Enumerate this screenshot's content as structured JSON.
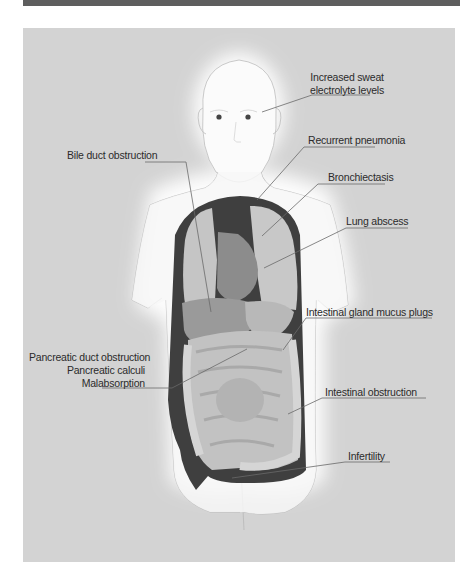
{
  "figure": {
    "colors": {
      "top_bar": "#5e5e5e",
      "panel_background": "#d3d3d3",
      "body_fill": "#f7f7f7",
      "body_glow": "#ffffff",
      "cavity_dark": "#404040",
      "organ_light": "#c4c4c4",
      "organ_mid": "#a8a8a8",
      "organ_dark": "#8e8e8e",
      "leader_line": "#6a6a6a"
    },
    "labels": {
      "sweat": "Increased sweat electrolyte levels",
      "sweat_line1": "Increased sweat",
      "sweat_line2": "electrolyte levels",
      "pneumonia": "Recurrent pneumonia",
      "bronchiectasis": "Bronchiectasis",
      "lung_abscess": "Lung abscess",
      "bile_duct": "Bile duct obstruction",
      "mucus_plugs": "Intestinal gland mucus plugs",
      "pancreatic_duct": "Pancreatic duct obstruction",
      "pancreatic_calculi": "Pancreatic calculi",
      "malabsorption": "Malabsorption",
      "intestinal_obstruction": "Intestinal obstruction",
      "infertility": "Infertility"
    }
  }
}
